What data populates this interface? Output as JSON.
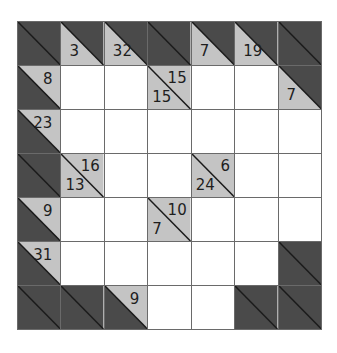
{
  "puzzle": {
    "type": "kakuro",
    "rows": 7,
    "cols": 7,
    "colors": {
      "block": "#4a4a4a",
      "clue_bg": "#c4c4c4",
      "white": "#ffffff",
      "grid_line": "#6a6a6a",
      "text": "#1e1e1e"
    },
    "grid": [
      [
        {
          "kind": "block"
        },
        {
          "kind": "clue",
          "down": "3",
          "right": null
        },
        {
          "kind": "clue",
          "down": "32",
          "right": null
        },
        {
          "kind": "block"
        },
        {
          "kind": "clue",
          "down": "7",
          "right": null
        },
        {
          "kind": "clue",
          "down": "19",
          "right": null
        },
        {
          "kind": "block"
        }
      ],
      [
        {
          "kind": "clue",
          "down": null,
          "right": "8"
        },
        {
          "kind": "white",
          "value": ""
        },
        {
          "kind": "white",
          "value": ""
        },
        {
          "kind": "clue",
          "down": "15",
          "right": "15"
        },
        {
          "kind": "white",
          "value": ""
        },
        {
          "kind": "white",
          "value": ""
        },
        {
          "kind": "clue",
          "down": "7",
          "right": null
        }
      ],
      [
        {
          "kind": "clue",
          "down": null,
          "right": "23"
        },
        {
          "kind": "white",
          "value": ""
        },
        {
          "kind": "white",
          "value": ""
        },
        {
          "kind": "white",
          "value": ""
        },
        {
          "kind": "white",
          "value": ""
        },
        {
          "kind": "white",
          "value": ""
        },
        {
          "kind": "white",
          "value": ""
        }
      ],
      [
        {
          "kind": "block"
        },
        {
          "kind": "clue",
          "down": "13",
          "right": "16"
        },
        {
          "kind": "white",
          "value": ""
        },
        {
          "kind": "white",
          "value": ""
        },
        {
          "kind": "clue",
          "down": "24",
          "right": "6"
        },
        {
          "kind": "white",
          "value": ""
        },
        {
          "kind": "white",
          "value": ""
        }
      ],
      [
        {
          "kind": "clue",
          "down": null,
          "right": "9"
        },
        {
          "kind": "white",
          "value": ""
        },
        {
          "kind": "white",
          "value": ""
        },
        {
          "kind": "clue",
          "down": "7",
          "right": "10"
        },
        {
          "kind": "white",
          "value": ""
        },
        {
          "kind": "white",
          "value": ""
        },
        {
          "kind": "white",
          "value": ""
        }
      ],
      [
        {
          "kind": "clue",
          "down": null,
          "right": "31"
        },
        {
          "kind": "white",
          "value": ""
        },
        {
          "kind": "white",
          "value": ""
        },
        {
          "kind": "white",
          "value": ""
        },
        {
          "kind": "white",
          "value": ""
        },
        {
          "kind": "white",
          "value": ""
        },
        {
          "kind": "block"
        }
      ],
      [
        {
          "kind": "block"
        },
        {
          "kind": "block"
        },
        {
          "kind": "clue",
          "down": null,
          "right": "9"
        },
        {
          "kind": "white",
          "value": ""
        },
        {
          "kind": "white",
          "value": ""
        },
        {
          "kind": "block"
        },
        {
          "kind": "block"
        }
      ]
    ]
  }
}
